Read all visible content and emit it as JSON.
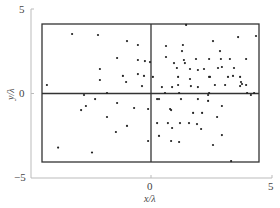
{
  "chart_data": {
    "type": "scatter",
    "title": "",
    "xlabel": "x/λ",
    "ylabel": "y/λ",
    "xlim": [
      -5,
      5
    ],
    "ylim": [
      -5,
      5
    ],
    "xticks": [
      "0",
      "5"
    ],
    "yticks": [
      "5",
      "0",
      "−5"
    ],
    "grid": false,
    "legend": null,
    "annotations": {
      "rectangle": {
        "x0": -4.5,
        "x1": 4.5,
        "y0": -4.05,
        "y1": 4.1
      },
      "crosshair": {
        "x": 0,
        "y": 0
      }
    },
    "colors": {
      "points": "#222222",
      "axes": "#bbbbbb",
      "box": "#333333"
    },
    "points_px": [
      [
        72,
        34
      ],
      [
        98,
        35
      ],
      [
        48,
        85
      ],
      [
        127,
        41
      ],
      [
        138,
        45
      ],
      [
        117,
        58
      ],
      [
        138,
        60
      ],
      [
        145,
        61
      ],
      [
        100,
        69
      ],
      [
        100,
        80
      ],
      [
        123,
        76
      ],
      [
        138,
        74
      ],
      [
        144,
        76
      ],
      [
        126,
        82
      ],
      [
        142,
        86
      ],
      [
        186,
        25
      ],
      [
        166,
        46
      ],
      [
        183,
        45
      ],
      [
        182,
        51
      ],
      [
        166,
        57
      ],
      [
        174,
        63
      ],
      [
        184,
        60
      ],
      [
        185,
        63
      ],
      [
        196,
        59
      ],
      [
        177,
        68
      ],
      [
        190,
        69
      ],
      [
        178,
        77
      ],
      [
        190,
        79
      ],
      [
        198,
        70
      ],
      [
        204,
        69
      ],
      [
        209,
        77
      ],
      [
        178,
        85
      ],
      [
        162,
        87
      ],
      [
        172,
        87
      ],
      [
        191,
        86
      ],
      [
        198,
        87
      ],
      [
        150,
        62
      ],
      [
        153,
        77
      ],
      [
        236,
        37
      ],
      [
        254,
        36
      ],
      [
        213,
        41
      ],
      [
        220,
        51
      ],
      [
        209,
        59
      ],
      [
        221,
        59
      ],
      [
        230,
        59
      ],
      [
        246,
        59
      ],
      [
        218,
        68
      ],
      [
        222,
        67
      ],
      [
        234,
        68
      ],
      [
        233,
        76
      ],
      [
        240,
        77
      ],
      [
        210,
        77
      ],
      [
        228,
        77
      ],
      [
        241,
        82
      ],
      [
        242,
        84
      ],
      [
        215,
        85
      ],
      [
        225,
        85
      ],
      [
        240,
        86
      ],
      [
        246,
        85
      ],
      [
        84,
        95
      ],
      [
        86,
        106
      ],
      [
        81,
        110
      ],
      [
        58,
        148
      ],
      [
        92,
        153
      ],
      [
        107,
        93
      ],
      [
        95,
        99
      ],
      [
        117,
        103
      ],
      [
        134,
        108
      ],
      [
        107,
        117
      ],
      [
        127,
        126
      ],
      [
        116,
        132
      ],
      [
        148,
        141
      ],
      [
        148,
        109
      ],
      [
        157,
        99
      ],
      [
        159,
        99
      ],
      [
        165,
        93
      ],
      [
        181,
        99
      ],
      [
        179,
        93
      ],
      [
        170,
        109
      ],
      [
        171,
        110
      ],
      [
        198,
        99
      ],
      [
        193,
        113
      ],
      [
        202,
        113
      ],
      [
        208,
        95
      ],
      [
        208,
        101
      ],
      [
        157,
        123
      ],
      [
        168,
        123
      ],
      [
        180,
        123
      ],
      [
        189,
        123
      ],
      [
        197,
        124
      ],
      [
        172,
        128
      ],
      [
        201,
        129
      ],
      [
        159,
        136
      ],
      [
        171,
        141
      ],
      [
        179,
        142
      ],
      [
        209,
        93
      ],
      [
        247,
        93
      ],
      [
        251,
        95
      ],
      [
        254,
        93
      ],
      [
        222,
        106
      ],
      [
        217,
        117
      ],
      [
        222,
        135
      ],
      [
        213,
        145
      ],
      [
        231,
        161
      ]
    ],
    "x": [
      -3.26,
      -2.19,
      -4.3,
      -0.99,
      -0.54,
      -1.4,
      -0.54,
      -0.25,
      -2.11,
      -2.11,
      -1.16,
      -0.54,
      -0.29,
      -1.03,
      -0.37,
      1.45,
      0.62,
      1.32,
      1.28,
      0.62,
      0.95,
      1.36,
      1.4,
      1.86,
      1.07,
      1.61,
      1.12,
      1.61,
      1.94,
      2.19,
      2.4,
      1.12,
      0.45,
      0.87,
      1.65,
      1.94,
      -0.04,
      0.08,
      3.6,
      4.34,
      2.56,
      2.85,
      2.4,
      2.89,
      3.26,
      3.93,
      2.77,
      2.93,
      3.43,
      3.39,
      3.68,
      2.44,
      3.18,
      3.72,
      3.76,
      2.64,
      3.06,
      3.68,
      3.93,
      -2.77,
      -2.69,
      -2.89,
      -3.84,
      -2.44,
      -1.82,
      -2.31,
      -1.4,
      -0.7,
      -1.82,
      -0.99,
      -1.45,
      -0.12,
      -0.12,
      0.25,
      0.33,
      0.58,
      1.24,
      1.16,
      0.79,
      0.83,
      1.94,
      1.74,
      2.11,
      2.36,
      2.36,
      0.25,
      0.7,
      1.2,
      1.57,
      1.9,
      0.87,
      2.07,
      0.33,
      0.83,
      1.16,
      2.4,
      3.97,
      4.13,
      4.26,
      2.93,
      2.73,
      2.93,
      2.56,
      3.31
    ],
    "y": [
      3.52,
      3.46,
      0.5,
      3.1,
      2.87,
      2.1,
      1.98,
      1.92,
      1.45,
      0.8,
      1.04,
      1.15,
      1.04,
      0.68,
      0.44,
      4.06,
      2.81,
      2.87,
      2.51,
      2.16,
      1.8,
      1.98,
      1.8,
      2.04,
      1.51,
      1.45,
      0.98,
      0.86,
      1.39,
      1.45,
      0.98,
      0.5,
      0.38,
      0.38,
      0.44,
      0.38,
      1.86,
      0.98,
      3.34,
      3.4,
      3.1,
      2.51,
      2.04,
      2.04,
      2.04,
      2.04,
      1.51,
      1.57,
      1.51,
      1.04,
      0.98,
      0.98,
      0.98,
      0.68,
      0.56,
      0.5,
      0.5,
      0.44,
      0.5,
      -0.09,
      -0.74,
      -0.98,
      -3.2,
      -3.49,
      0.03,
      -0.33,
      -0.56,
      -0.86,
      -1.39,
      -1.92,
      -2.28,
      -2.81,
      -0.92,
      -0.33,
      -0.33,
      0.03,
      -0.33,
      0.03,
      -0.92,
      -0.98,
      -0.33,
      -1.15,
      -1.15,
      -0.09,
      -0.44,
      -1.75,
      -1.75,
      -1.75,
      -1.75,
      -1.81,
      -2.04,
      -2.1,
      -2.51,
      -2.81,
      -2.87,
      0.03,
      0.03,
      -0.09,
      0.03,
      -0.74,
      -1.39,
      -2.46,
      -3.05,
      -4.0
    ]
  }
}
